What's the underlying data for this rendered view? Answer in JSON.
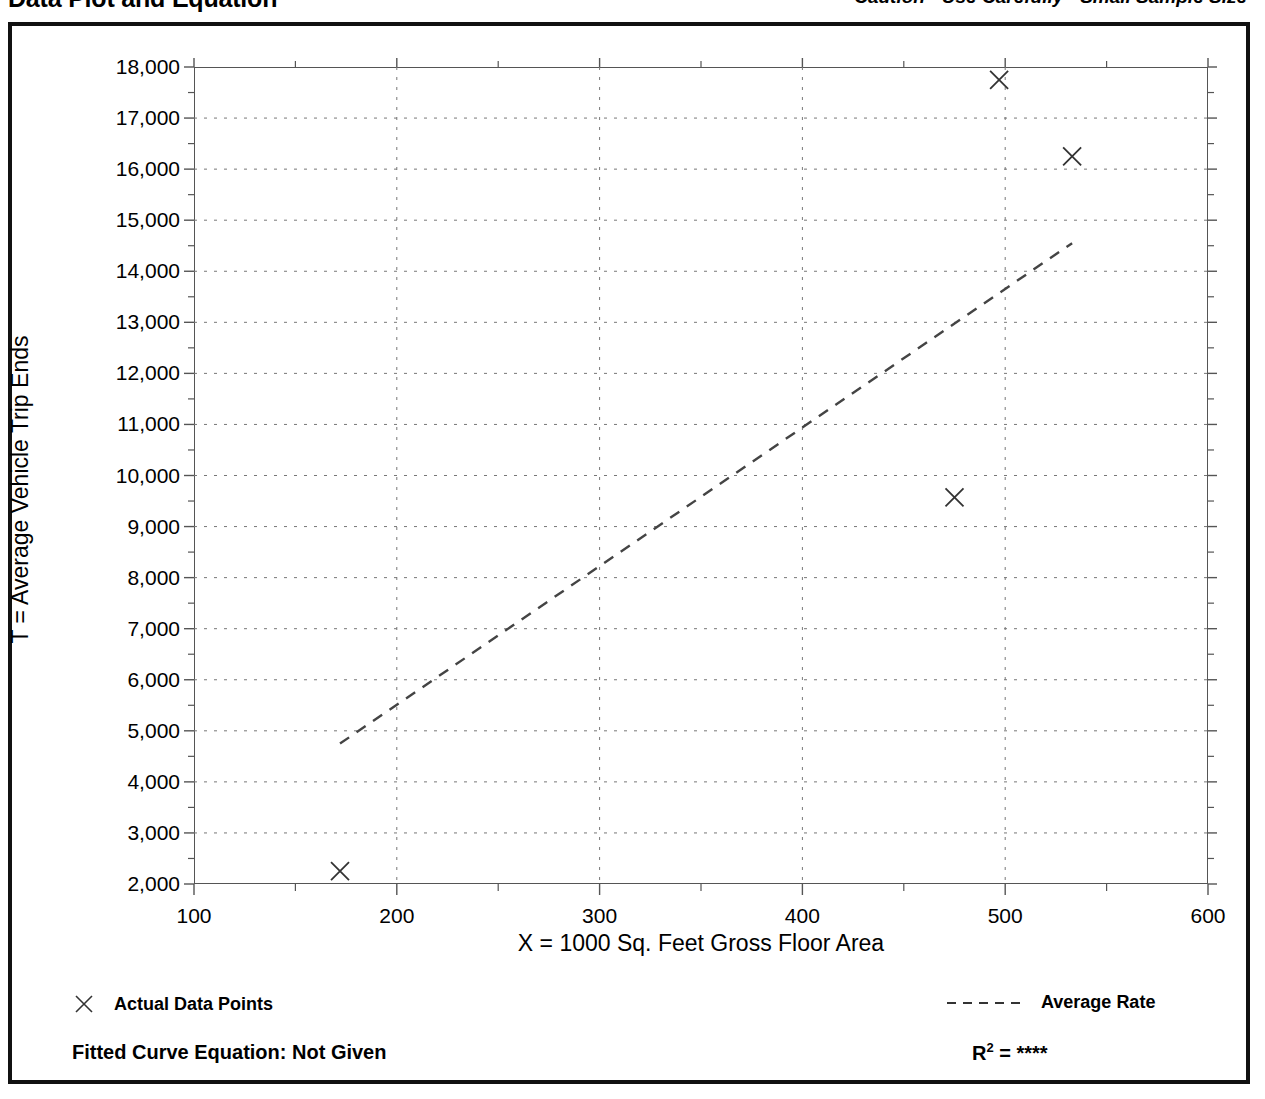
{
  "header": {
    "title": "Data Plot and Equation",
    "caution": "Caution - Use Carefully - Small Sample Size"
  },
  "legend": {
    "data_points_label": "Actual Data Points",
    "average_rate_label": "Average Rate",
    "data_points_marker": "x-marker-icon",
    "average_rate_marker": "dashed-line-icon"
  },
  "footer": {
    "equation_label": "Fitted Curve Equation:  Not Given",
    "r2_prefix": "R",
    "r2_exponent": "2",
    "r2_equals": " = ",
    "r2_value": "****"
  },
  "colors": {
    "ink": "#000000",
    "axis": "#555555",
    "grid": "#777777",
    "border": "#111111"
  },
  "chart_data": {
    "type": "scatter",
    "title": "Data Plot and Equation",
    "subtitle": "Caution - Use Carefully - Small Sample Size",
    "xlabel": "X = 1000 Sq. Feet Gross Floor Area",
    "ylabel": "T = Average Vehicle Trip Ends",
    "xlim": [
      100,
      600
    ],
    "ylim": [
      2000,
      18000
    ],
    "xticks": [
      100,
      200,
      300,
      400,
      500,
      600
    ],
    "xtick_labels": [
      "100",
      "200",
      "300",
      "400",
      "500",
      "600"
    ],
    "xminor_step": 50,
    "yticks": [
      2000,
      3000,
      4000,
      5000,
      6000,
      7000,
      8000,
      9000,
      10000,
      11000,
      12000,
      13000,
      14000,
      15000,
      16000,
      17000,
      18000
    ],
    "ytick_labels": [
      "2,000",
      "3,000",
      "4,000",
      "5,000",
      "6,000",
      "7,000",
      "8,000",
      "9,000",
      "10,000",
      "11,000",
      "12,000",
      "13,000",
      "14,000",
      "15,000",
      "16,000",
      "17,000",
      "18,000"
    ],
    "yminor_step": 500,
    "grid": true,
    "grid_style": "dotted",
    "legend_position": "below-plot",
    "series": [
      {
        "name": "Actual Data Points",
        "type": "scatter",
        "marker": "x",
        "points": [
          {
            "x": 172,
            "y": 2250
          },
          {
            "x": 475,
            "y": 9570
          },
          {
            "x": 497,
            "y": 17750
          },
          {
            "x": 533,
            "y": 16250
          }
        ]
      },
      {
        "name": "Average Rate",
        "type": "line",
        "style": "dashed",
        "points": [
          {
            "x": 172,
            "y": 4750
          },
          {
            "x": 533,
            "y": 14550
          }
        ]
      }
    ]
  }
}
